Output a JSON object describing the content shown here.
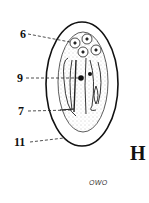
{
  "figure": {
    "panel_letter": "H",
    "caption": "OWO",
    "labels": [
      {
        "id": "6",
        "text": "6"
      },
      {
        "id": "9",
        "text": "9"
      },
      {
        "id": "7",
        "text": "7"
      },
      {
        "id": "11",
        "text": "11"
      }
    ]
  },
  "colors": {
    "outline": "#111111",
    "stipple": "#777777",
    "background": "#ffffff"
  }
}
